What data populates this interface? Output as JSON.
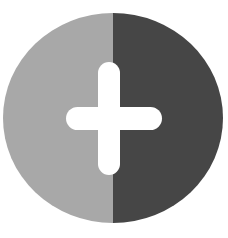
{
  "icon": {
    "name": "split-circle-plus",
    "description": "Circle split vertically into a light gray left half and dark gray right half, with a white rounded plus sign at the center",
    "colors": {
      "background": "#ffffff",
      "left_half": "#a8a8a8",
      "right_half": "#464646",
      "plus": "#ffffff"
    }
  }
}
